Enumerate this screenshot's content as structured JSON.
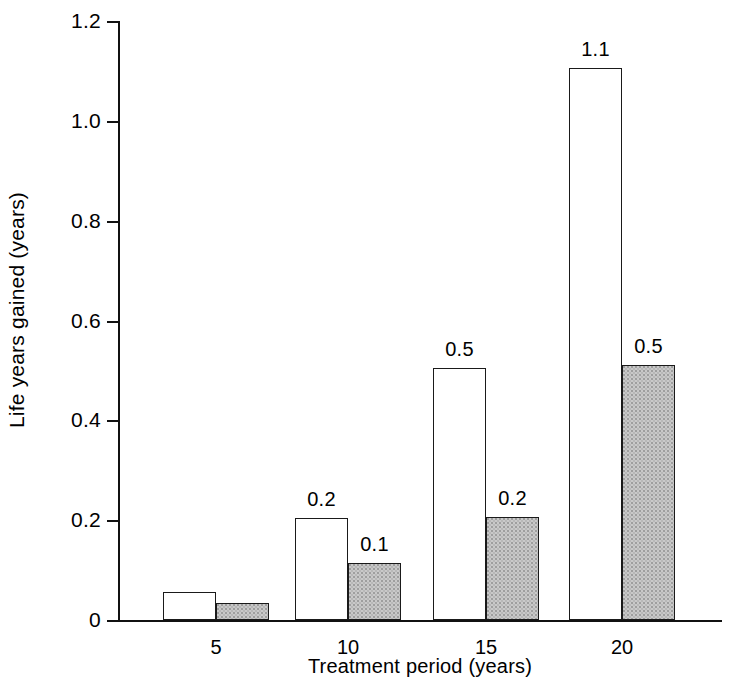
{
  "chart_data": {
    "type": "bar",
    "title": "",
    "subtitle": "",
    "xlabel": "Treatment period (years)",
    "ylabel": "Life years gained (years)",
    "categories": [
      "5",
      "10",
      "15",
      "20"
    ],
    "series": [
      {
        "name": "open-bars",
        "style": "white-open",
        "values": [
          0.056,
          0.205,
          0.505,
          1.105
        ],
        "labels": [
          "",
          "0.2",
          "0.5",
          "1.1"
        ]
      },
      {
        "name": "shaded-bars",
        "style": "gray-stippled",
        "values": [
          0.034,
          0.114,
          0.207,
          0.51
        ],
        "labels": [
          "",
          "0.1",
          "0.2",
          "0.5"
        ]
      }
    ],
    "ylim": [
      0,
      1.2
    ],
    "yticks": [
      0,
      0.2,
      0.4,
      0.6,
      0.8,
      1.0,
      1.2
    ],
    "ytick_labels": [
      "0",
      "0.2",
      "0.4",
      "0.6",
      "0.8",
      "1.0",
      "1.2"
    ],
    "xtick_labels": [
      "5",
      "10",
      "15",
      "20"
    ],
    "grid": false,
    "legend": "none",
    "colors": {
      "axis": "#111111",
      "open_bar_fill": "#ffffff",
      "open_bar_edge": "#1a1a1a",
      "shaded_bar_fill": "#c9c9c9",
      "shaded_bar_edge": "#1a1a1a",
      "text": "#000000"
    }
  }
}
